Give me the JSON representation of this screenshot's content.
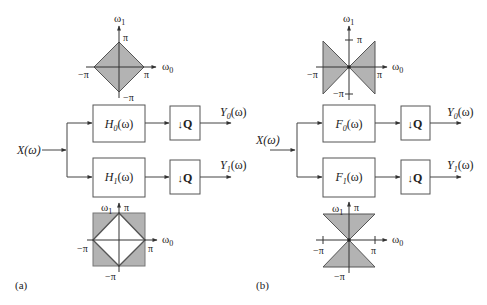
{
  "panels": [
    {
      "id": "a",
      "caption": "(a)",
      "input_label": "X(ω)",
      "filters": [
        {
          "name": "H",
          "sub": "0",
          "arg": "(ω)",
          "output_name": "Y",
          "output_sub": "0",
          "output_arg": "(ω)",
          "downsampler": "Q"
        },
        {
          "name": "H",
          "sub": "1",
          "arg": "(ω)",
          "output_name": "Y",
          "output_sub": "1",
          "output_arg": "(ω)",
          "downsampler": "Q"
        }
      ],
      "top_plot": {
        "shape": "diamond (lowpass)",
        "x_axis": "ω",
        "x_sub": "0",
        "y_axis": "ω",
        "y_sub": "1",
        "pi": "π",
        "neg_pi": "−π"
      },
      "bottom_plot": {
        "shape": "square minus diamond (highpass)",
        "x_axis": "ω",
        "x_sub": "0",
        "y_axis": "ω",
        "y_sub": "1",
        "pi": "π",
        "neg_pi": "−π"
      }
    },
    {
      "id": "b",
      "caption": "(b)",
      "input_label": "X(ω)",
      "filters": [
        {
          "name": "F",
          "sub": "0",
          "arg": "(ω)",
          "output_name": "Y",
          "output_sub": "0",
          "output_arg": "(ω)",
          "downsampler": "Q"
        },
        {
          "name": "F",
          "sub": "1",
          "arg": "(ω)",
          "output_name": "Y",
          "output_sub": "1",
          "output_arg": "(ω)",
          "downsampler": "Q"
        }
      ],
      "top_plot": {
        "shape": "horizontal fan (bowtie)",
        "x_axis": "ω",
        "x_sub": "0",
        "y_axis": "ω",
        "y_sub": "1",
        "pi": "π",
        "neg_pi": "−π"
      },
      "bottom_plot": {
        "shape": "vertical fan (hourglass)",
        "x_axis": "ω",
        "x_sub": "0",
        "y_axis": "ω",
        "y_sub": "1",
        "pi": "π",
        "neg_pi": "−π"
      }
    }
  ],
  "colors": {
    "shade": "#b3b3b3",
    "line": "#444444",
    "background": "#ffffff"
  },
  "arrow_down": "↓"
}
